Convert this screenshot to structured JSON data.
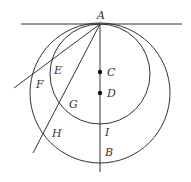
{
  "diagram": {
    "type": "geometry",
    "tangent_line": {
      "x1": 21,
      "y1": 24,
      "x2": 182,
      "y2": 24
    },
    "small_circle": {
      "center_label": "C",
      "cx": 100,
      "cy": 74,
      "r": 50
    },
    "large_circle": {
      "center_label": "D",
      "cx": 100,
      "cy": 93,
      "r": 70
    },
    "vertical_line": {
      "x1": 100,
      "y1": 24,
      "x2": 100,
      "y2": 172
    },
    "secant_1": {
      "x1": 100,
      "y1": 24,
      "x2": 14,
      "y2": 88,
      "through": [
        "E",
        "F"
      ]
    },
    "secant_2": {
      "x1": 100,
      "y1": 24,
      "x2": 33,
      "y2": 153,
      "through": [
        "G",
        "H"
      ]
    },
    "points": [
      {
        "name": "A",
        "label": "A",
        "x": 100,
        "y": 24,
        "lx": 97,
        "ly": 19
      },
      {
        "name": "C",
        "label": "C",
        "x": 100,
        "y": 72,
        "lx": 107,
        "ly": 76,
        "dot": true
      },
      {
        "name": "D",
        "label": "D",
        "x": 100,
        "y": 93,
        "lx": 107,
        "ly": 97,
        "dot": true
      },
      {
        "name": "E",
        "label": "E",
        "x": 51,
        "y": 61,
        "lx": 54,
        "ly": 74
      },
      {
        "name": "F",
        "label": "F",
        "x": 32,
        "y": 74,
        "lx": 36,
        "ly": 88
      },
      {
        "name": "G",
        "label": "G",
        "x": 59,
        "y": 104,
        "lx": 69,
        "ly": 108
      },
      {
        "name": "H",
        "label": "H",
        "x": 44,
        "y": 133,
        "lx": 52,
        "ly": 137
      },
      {
        "name": "I",
        "label": "I",
        "x": 100,
        "y": 124,
        "lx": 105,
        "ly": 136
      },
      {
        "name": "B",
        "label": "B",
        "x": 100,
        "y": 163,
        "lx": 105,
        "ly": 156
      }
    ]
  }
}
